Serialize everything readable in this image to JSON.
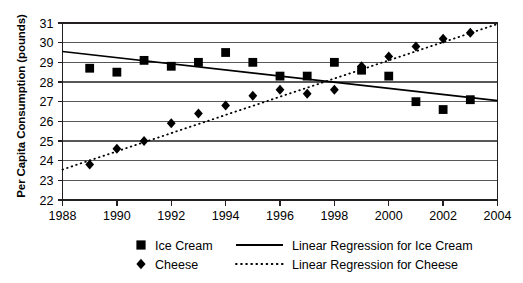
{
  "chart_data": {
    "type": "scatter",
    "title": "",
    "xlabel": "",
    "ylabel": "Per Capita Consumption (pounds)",
    "xlim": [
      1988,
      2004
    ],
    "ylim": [
      22,
      31
    ],
    "xticks": [
      1988,
      1990,
      1992,
      1994,
      1996,
      1998,
      2000,
      2002,
      2004
    ],
    "yticks": [
      22,
      23,
      24,
      25,
      26,
      27,
      28,
      29,
      30,
      31
    ],
    "grid": true,
    "legend_position": "bottom",
    "series": [
      {
        "name": "Ice Cream",
        "marker": "square",
        "color": "#000000",
        "x": [
          1989,
          1990,
          1991,
          1992,
          1993,
          1994,
          1995,
          1996,
          1997,
          1998,
          1999,
          2000,
          2001,
          2002,
          2003
        ],
        "values": [
          28.7,
          28.5,
          29.1,
          28.8,
          29.0,
          29.5,
          29.0,
          28.3,
          28.3,
          29.0,
          28.6,
          28.3,
          27.0,
          26.6,
          27.1
        ]
      },
      {
        "name": "Cheese",
        "marker": "diamond",
        "color": "#000000",
        "x": [
          1989,
          1990,
          1991,
          1992,
          1993,
          1994,
          1995,
          1996,
          1997,
          1998,
          1999,
          2000,
          2001,
          2002,
          2003
        ],
        "values": [
          23.8,
          24.6,
          25.0,
          25.9,
          26.4,
          26.8,
          27.3,
          27.6,
          27.4,
          27.6,
          28.8,
          29.3,
          29.8,
          30.2,
          30.5
        ]
      }
    ],
    "trendlines": [
      {
        "name": "Linear Regression for Ice Cream",
        "style": "solid",
        "color": "#000000",
        "x0": 1988,
        "y0": 29.55,
        "x1": 2004,
        "y1": 27.05
      },
      {
        "name": "Linear Regression for Cheese",
        "style": "dotted",
        "color": "#000000",
        "x0": 1988,
        "y0": 23.55,
        "x1": 2004,
        "y1": 30.95
      }
    ]
  },
  "legend": {
    "entries": [
      {
        "marker_name": "square-marker",
        "label": "Ice Cream",
        "line_name": "solid-line-sample",
        "line_label": "Linear Regression for Ice Cream"
      },
      {
        "marker_name": "diamond-marker",
        "label": "Cheese",
        "line_name": "dotted-line-sample",
        "line_label": "Linear Regression for Cheese"
      }
    ]
  },
  "axis": {
    "y_title": "Per Capita Consumption (pounds)",
    "x_tick_labels": [
      "1988",
      "1990",
      "1992",
      "1994",
      "1996",
      "1998",
      "2000",
      "2002",
      "2004"
    ],
    "y_tick_labels": [
      "31",
      "30",
      "29",
      "28",
      "27",
      "26",
      "25",
      "24",
      "23",
      "22"
    ]
  },
  "colors": {
    "axis": "#231f20",
    "grid": "#58585a",
    "marker": "#000000",
    "background": "#ffffff"
  }
}
